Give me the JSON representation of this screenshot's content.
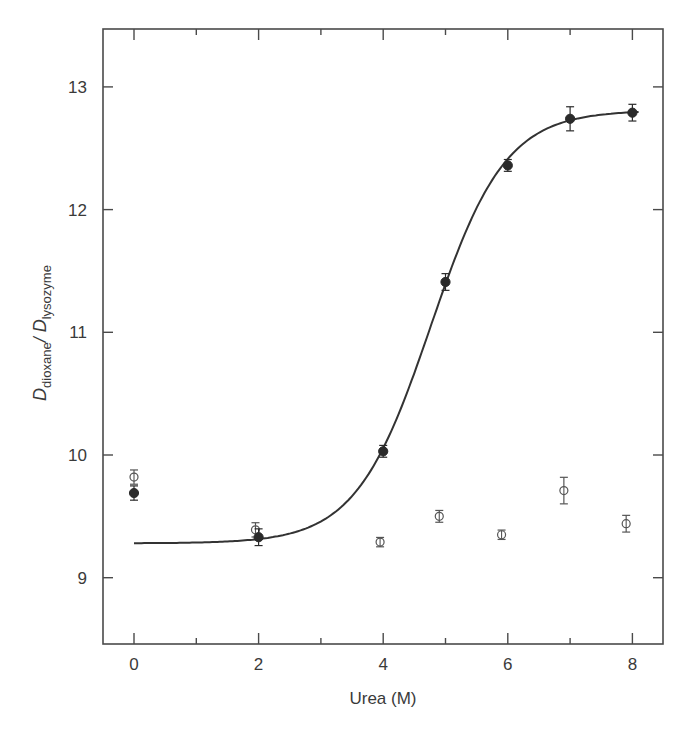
{
  "chart_data": {
    "type": "scatter",
    "title": "",
    "xlabel": "Urea (M)",
    "ylabel": {
      "main1": "D",
      "sub1": "dioxane",
      "sep": "/ ",
      "main2": "D",
      "sub2": "lysozyme",
      "full": "D_dioxane / D_lysozyme"
    },
    "xlim": [
      -0.5,
      8.5
    ],
    "ylim": [
      8.45,
      13.5
    ],
    "x_ticks_major": [
      0,
      2,
      4,
      6,
      8
    ],
    "x_tick_labels": [
      "0",
      "2",
      "4",
      "6",
      "8"
    ],
    "x_ticks_minor": [
      1,
      3,
      5,
      7
    ],
    "y_ticks": [
      9,
      10,
      11,
      12,
      13
    ],
    "y_tick_labels": [
      "9",
      "10",
      "11",
      "12",
      "13"
    ],
    "grid": false,
    "legend": null,
    "series": [
      {
        "name": "filled circles",
        "marker": "filled-circle",
        "x": [
          0,
          2,
          4,
          5,
          6,
          7,
          8
        ],
        "y": [
          9.69,
          9.33,
          10.03,
          11.41,
          12.36,
          12.74,
          12.79
        ],
        "yerr": [
          0.05,
          0.06,
          0.04,
          0.06,
          0.04,
          0.09,
          0.06
        ]
      },
      {
        "name": "open circles",
        "marker": "open-circle",
        "x": [
          0,
          1.95,
          3.95,
          4.9,
          5.9,
          6.9,
          7.9
        ],
        "y": [
          9.82,
          9.39,
          9.29,
          9.5,
          9.35,
          9.71,
          9.44
        ],
        "yerr": [
          0.05,
          0.05,
          0.03,
          0.04,
          0.03,
          0.1,
          0.06
        ]
      }
    ],
    "fit_curve": {
      "type": "sigmoid",
      "baseline": 9.28,
      "plateau": 12.81,
      "midpoint": 4.76,
      "width": 0.6,
      "x_range": [
        0,
        8.1
      ]
    }
  }
}
